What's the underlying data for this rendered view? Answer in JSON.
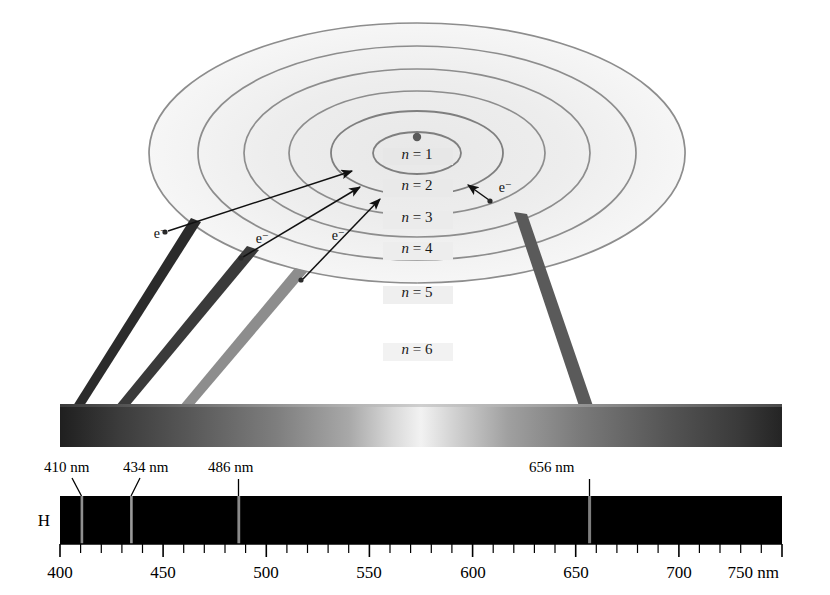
{
  "figure": {
    "background_color": "#ffffff"
  },
  "atom": {
    "nucleus_name": "nucleus",
    "center_x": 417,
    "center_y": 153,
    "orbits": [
      {
        "label_n": "n",
        "label_eq": " = ",
        "label_value": "1",
        "full": "n = 1",
        "rx": 44,
        "ry": 21,
        "label_x": 417,
        "label_y": 159
      },
      {
        "label_n": "n",
        "label_eq": " = ",
        "label_value": "2",
        "full": "n = 2",
        "rx": 86,
        "ry": 42,
        "label_x": 417,
        "label_y": 190
      },
      {
        "label_n": "n",
        "label_eq": " = ",
        "label_value": "3",
        "full": "n = 3",
        "rx": 128,
        "ry": 62,
        "label_x": 417,
        "label_y": 222
      },
      {
        "label_n": "n",
        "label_eq": " = ",
        "label_value": "4",
        "full": "n = 4",
        "rx": 173,
        "ry": 84,
        "label_x": 417,
        "label_y": 253
      },
      {
        "label_n": "n",
        "label_eq": " = ",
        "label_value": "5",
        "full": "n = 5",
        "rx": 219,
        "ry": 107,
        "label_x": 417,
        "label_y": 297
      },
      {
        "label_n": "n",
        "label_eq": " = ",
        "label_value": "6",
        "full": "n = 6",
        "rx": 268,
        "ry": 130,
        "label_x": 417,
        "label_y": 354
      }
    ],
    "electrons": [
      {
        "name": "electron-n6-left",
        "label": "e−",
        "dot_x": 165,
        "dot_y": 232,
        "label_x": 172,
        "label_y": 235,
        "arrow_to_x": 355,
        "arrow_to_y": 172
      },
      {
        "name": "electron-n5-left",
        "label": "e−",
        "dot_x": 240,
        "dot_y": 258,
        "label_x": 262,
        "label_y": 240,
        "arrow_to_x": 362,
        "arrow_to_y": 188
      },
      {
        "name": "electron-n4-mid",
        "label": "e−",
        "dot_x": 300,
        "dot_y": 280,
        "label_x": 338,
        "label_y": 237,
        "arrow_to_x": 382,
        "arrow_to_y": 199
      },
      {
        "name": "electron-n6-right",
        "label": "e−",
        "dot_x": 490,
        "dot_y": 201,
        "label_x": 497,
        "label_y": 190,
        "arrow_to_x": 469,
        "arrow_to_y": 186
      }
    ]
  },
  "continuous_spectrum": {
    "name": "continuous-spectrum-bar",
    "x": 60,
    "y": 404,
    "width": 722,
    "height": 43,
    "description": "grayscale continuous spectrum band",
    "beams": [
      {
        "name": "beam-410",
        "top_x": 196,
        "bottom_x": 78,
        "width": 11,
        "color": "#2b2b2b"
      },
      {
        "name": "beam-434",
        "top_x": 252,
        "bottom_x": 122,
        "width": 13,
        "color": "#3a3a3a"
      },
      {
        "name": "beam-486",
        "top_x": 300,
        "bottom_x": 186,
        "width": 13,
        "color": "#8a8a8a"
      },
      {
        "name": "beam-656",
        "top_x": 520,
        "bottom_x": 586,
        "width": 14,
        "color": "#585858"
      }
    ]
  },
  "line_spectrum": {
    "name": "hydrogen-line-spectrum",
    "element_label": "H",
    "x": 60,
    "y": 496,
    "width": 722,
    "height": 48,
    "band_color": "#000000",
    "scale_min": 400,
    "scale_max": 750,
    "minor_tick_step": 10,
    "major_tick_step": 50,
    "unit": "nm",
    "emission_lines": [
      {
        "name": "line-410",
        "wavelength": 410,
        "label": "410 nm",
        "label_x": 42,
        "label_y": 472,
        "leader": "angled"
      },
      {
        "name": "line-434",
        "wavelength": 434,
        "label": "434 nm",
        "label_x": 127,
        "label_y": 472,
        "leader": "angled"
      },
      {
        "name": "line-486",
        "wavelength": 486,
        "label": "486 nm",
        "label_x": 212,
        "label_y": 472,
        "leader": "vertical"
      },
      {
        "name": "line-656",
        "wavelength": 656,
        "label": "656 nm",
        "label_x": 525,
        "label_y": 472,
        "leader": "vertical"
      }
    ],
    "axis_ticks": [
      {
        "value": 400,
        "label": "400"
      },
      {
        "value": 450,
        "label": "450"
      },
      {
        "value": 500,
        "label": "500"
      },
      {
        "value": 550,
        "label": "550"
      },
      {
        "value": 600,
        "label": "600"
      },
      {
        "value": 650,
        "label": "650"
      },
      {
        "value": 700,
        "label": "700"
      },
      {
        "value": 750,
        "label": "750 nm"
      }
    ]
  },
  "chart_data": {
    "type": "line",
    "xlabel": "Wavelength (nm)",
    "ylabel": "",
    "xlim": [
      400,
      750
    ],
    "grid": false,
    "legend": "none",
    "categories": [
      "410 nm",
      "434 nm",
      "486 nm",
      "656 nm"
    ],
    "values": [
      410,
      434,
      486,
      656
    ],
    "annotations": [
      "n = 1",
      "n = 2",
      "n = 3",
      "n = 4",
      "n = 5",
      "n = 6",
      "e−",
      "H"
    ]
  }
}
